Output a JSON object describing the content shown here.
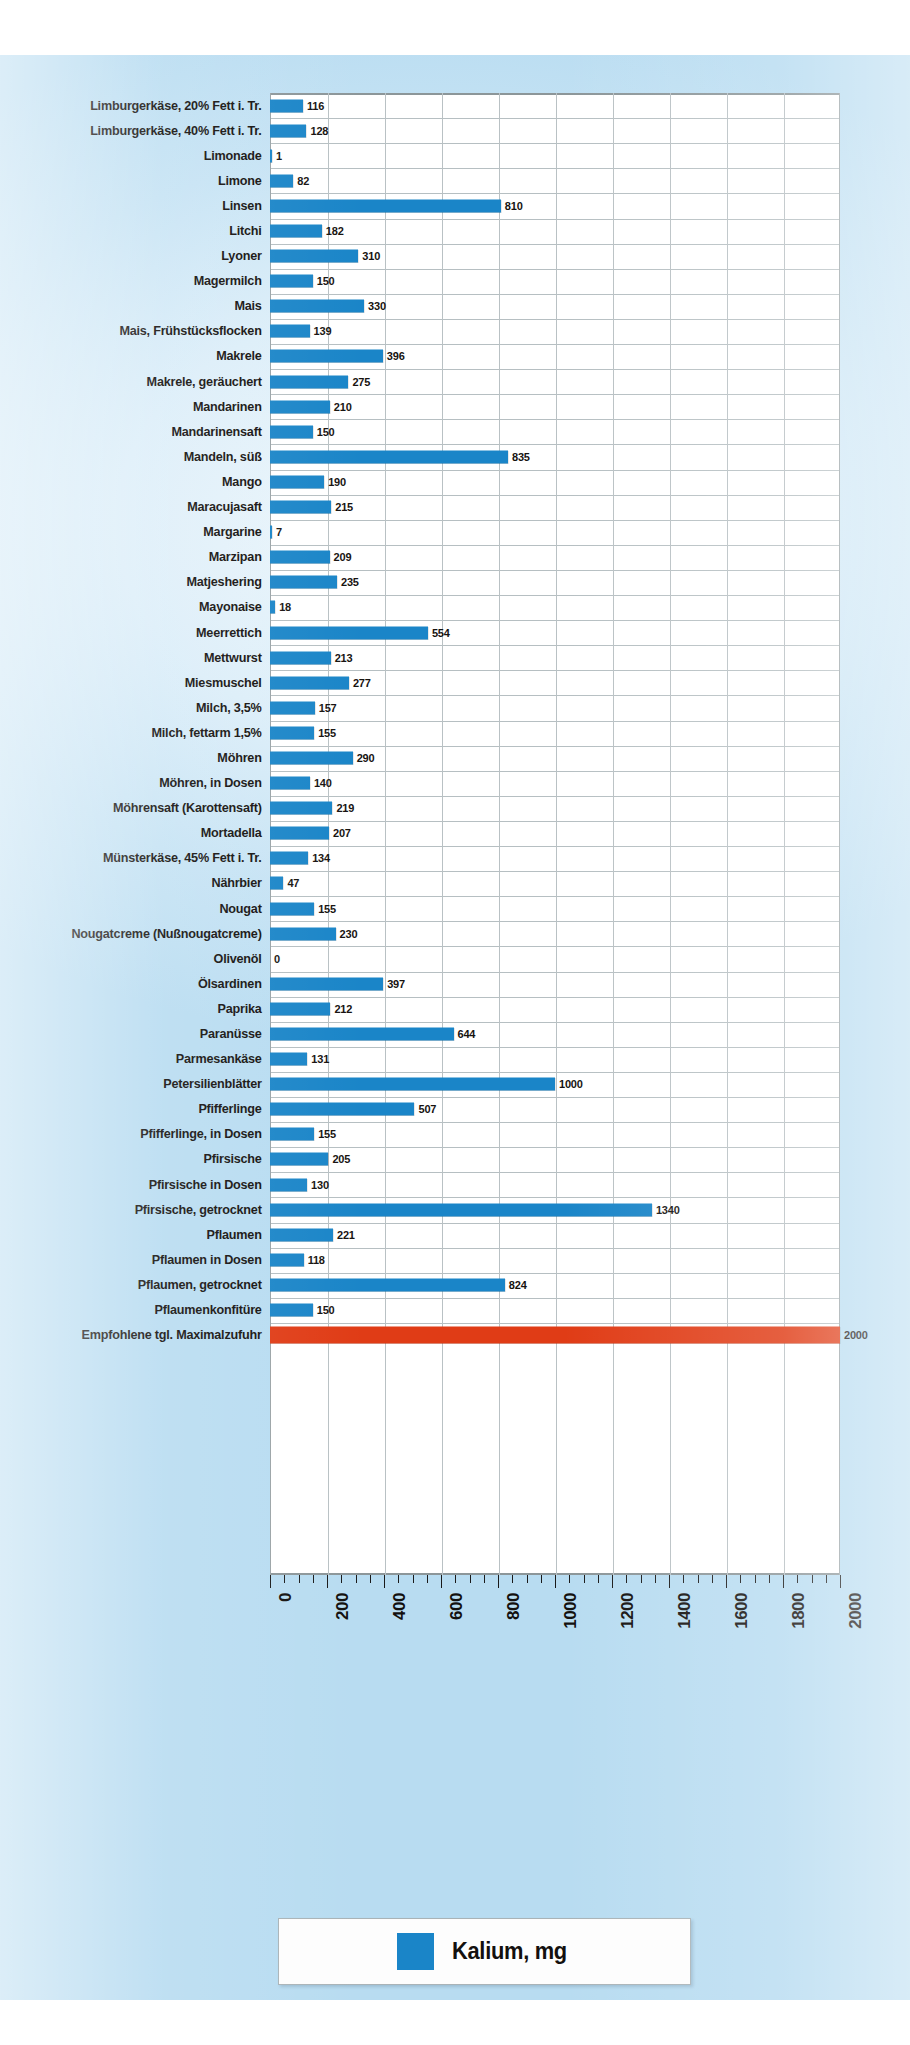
{
  "chart_data": {
    "type": "bar",
    "orientation": "horizontal",
    "title": "",
    "xlabel": "",
    "ylabel": "",
    "xlim": [
      0,
      2000
    ],
    "grid": true,
    "legend_position": "bottom",
    "legend": [
      {
        "label": "Kalium, mg",
        "color": "#1a85c8"
      }
    ],
    "series_name": "Kalium, mg",
    "bar_color": "#1a85c8",
    "highlight_color": "#e03c16",
    "xticks": [
      0,
      200,
      400,
      600,
      800,
      1000,
      1200,
      1400,
      1600,
      1800,
      2000
    ],
    "xtick_labels": [
      "0",
      "200",
      "400",
      "600",
      "800",
      "1000",
      "1200",
      "1400",
      "1600",
      "1800",
      "2000"
    ],
    "categories": [
      "Limburgerkäse, 20% Fett i. Tr.",
      "Limburgerkäse, 40% Fett i. Tr.",
      "Limonade",
      "Limone",
      "Linsen",
      "Litchi",
      "Lyoner",
      "Magermilch",
      "Mais",
      "Mais, Frühstücksflocken",
      "Makrele",
      "Makrele, geräuchert",
      "Mandarinen",
      "Mandarinensaft",
      "Mandeln, süß",
      "Mango",
      "Maracujasaft",
      "Margarine",
      "Marzipan",
      "Matjeshering",
      "Mayonaise",
      "Meerrettich",
      "Mettwurst",
      "Miesmuschel",
      "Milch, 3,5%",
      "Milch, fettarm 1,5%",
      "Möhren",
      "Möhren, in Dosen",
      "Möhrensaft (Karottensaft)",
      "Mortadella",
      "Münsterkäse, 45% Fett i. Tr.",
      "Nährbier",
      "Nougat",
      "Nougatcreme (Nußnougatcreme)",
      "Olivenöl",
      "Ölsardinen",
      "Paprika",
      "Paranüsse",
      "Parmesankäse",
      "Petersilienblätter",
      "Pfifferlinge",
      "Pfifferlinge, in Dosen",
      "Pfirsische",
      "Pfirsische in Dosen",
      "Pfirsische, getrocknet",
      "Pflaumen",
      "Pflaumen in Dosen",
      "Pflaumen, getrocknet",
      "Pflaumenkonfitüre",
      "Empfohlene tgl. Maximalzufuhr"
    ],
    "values": [
      116,
      128,
      1,
      82,
      810,
      182,
      310,
      150,
      330,
      139,
      396,
      275,
      210,
      150,
      835,
      190,
      215,
      7,
      209,
      235,
      18,
      554,
      213,
      277,
      157,
      155,
      290,
      140,
      219,
      207,
      134,
      47,
      155,
      230,
      0,
      397,
      212,
      644,
      131,
      1000,
      507,
      155,
      205,
      130,
      1340,
      221,
      118,
      824,
      150,
      2000
    ],
    "highlight_index": 49
  }
}
